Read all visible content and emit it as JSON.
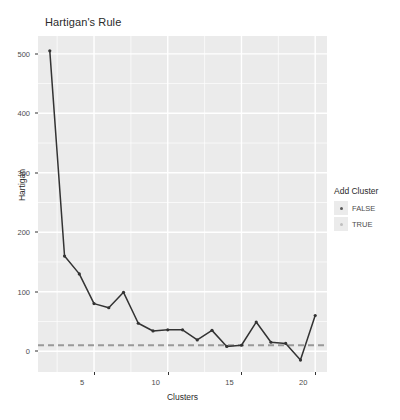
{
  "chart_data": {
    "type": "line",
    "title": "Hartigan's Rule",
    "xlabel": "Clusters",
    "ylabel": "Hartigan",
    "xlim": [
      1.2,
      20.8
    ],
    "ylim": [
      -35,
      530
    ],
    "grid": true,
    "x": [
      2,
      3,
      4,
      5,
      6,
      7,
      8,
      9,
      10,
      11,
      12,
      13,
      14,
      15,
      16,
      17,
      18,
      19,
      20
    ],
    "values": [
      505,
      160,
      130,
      80,
      73,
      99,
      47,
      34,
      36,
      36,
      19,
      35,
      8,
      10,
      49,
      15,
      13,
      -15,
      60
    ],
    "series": [
      {
        "name": "Hartigan",
        "values": [
          505,
          160,
          130,
          80,
          73,
          99,
          47,
          34,
          36,
          36,
          19,
          35,
          8,
          10,
          49,
          15,
          13,
          -15,
          60
        ]
      }
    ],
    "reference_line": {
      "y": 10,
      "style": "dashed",
      "color": "#999999"
    },
    "line_color": "#333333",
    "point_color": "#333333",
    "panel_background": "#ebebeb",
    "grid_color": "#ffffff",
    "xticks": [
      5,
      10,
      15,
      20
    ],
    "yticks": [
      0,
      100,
      200,
      300,
      400,
      500
    ],
    "y_minor_ticks": [
      50,
      150,
      250,
      350,
      450
    ],
    "x_minor_ticks": [
      2.5,
      7.5,
      12.5,
      17.5
    ],
    "legend": {
      "title": "Add Cluster",
      "position": "right",
      "entries": [
        {
          "label": "FALSE",
          "color": "#595959"
        },
        {
          "label": "TRUE",
          "color": "#bfbfbf"
        }
      ]
    }
  }
}
